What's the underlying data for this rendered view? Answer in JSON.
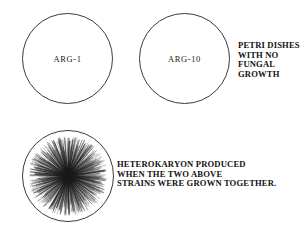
{
  "figure": {
    "background_color": "#ffffff",
    "line_color": "#3a3a3a",
    "text_color": "#111111"
  },
  "dishes": [
    {
      "id": "arg-1",
      "label": "ARG-1",
      "growth": false
    },
    {
      "id": "arg-10",
      "label": "ARG-10",
      "growth": false
    },
    {
      "id": "heterokaryon",
      "label": "",
      "growth": true
    }
  ],
  "captions": {
    "no_growth": {
      "line1": "PETRI DISHES",
      "line2": "WITH NO",
      "line3": "FUNGAL",
      "line4": "GROWTH"
    },
    "heterokaryon": {
      "line1": "HETEROKARYON PRODUCED",
      "line2": "WHEN THE TWO ABOVE",
      "line3": "STRAINS WERE GROWN TOGETHER."
    }
  },
  "growth_pattern": {
    "type": "radial-mycelium",
    "center_x": 68,
    "center_y": 176,
    "inner_radius": 2,
    "outer_radius": 40,
    "filament_count": 620,
    "color": "#1c1c1c"
  }
}
